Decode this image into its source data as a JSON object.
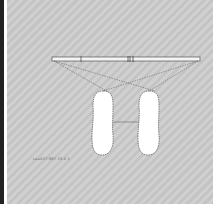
{
  "diagram": {
    "type": "footprint-alignment",
    "bar": {
      "x1": 52,
      "x2": 200,
      "y": 59,
      "marker_label": "|||"
    },
    "feet": [
      {
        "name": "left",
        "cx": 103,
        "top": 90,
        "bottom": 155,
        "width": 22
      },
      {
        "name": "right",
        "cx": 149,
        "top": 90,
        "bottom": 155,
        "width": 22
      }
    ],
    "caption": "Ls=627.887 25.0 1"
  },
  "colors": {
    "background": "#cccccc",
    "line": "#555555",
    "foot": "#ffffff"
  }
}
